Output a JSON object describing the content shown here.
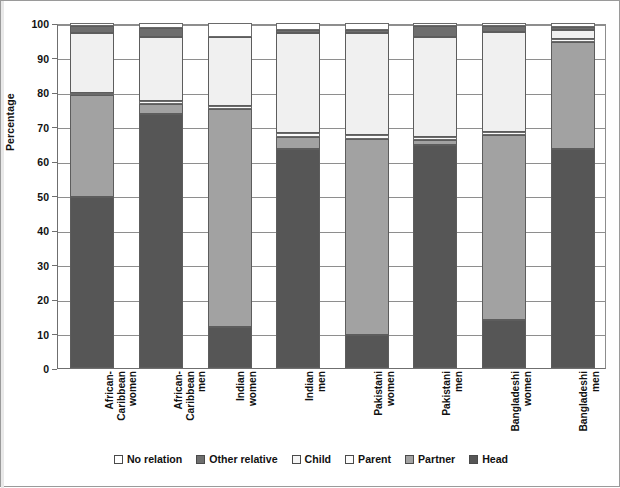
{
  "chart_data": {
    "type": "bar",
    "subtype": "stacked-bar-100",
    "title": "",
    "xlabel": "",
    "ylabel": "Percentage",
    "ylim": [
      0,
      100
    ],
    "yticks": [
      0,
      10,
      20,
      30,
      40,
      50,
      60,
      70,
      80,
      90,
      100
    ],
    "grid": true,
    "legend_position": "bottom",
    "categories": [
      "African-\nCaribbean\nwomen",
      "African-\nCaribbean\nmen",
      "Indian\nwomen",
      "Indian\nmen",
      "Pakistani\nwomen",
      "Pakistani\nmen",
      "Bangladeshi\nwomen",
      "Bangladeshi\nmen"
    ],
    "series": [
      {
        "name": "Head",
        "color": "#565656",
        "values": [
          49.5,
          73.5,
          12.0,
          63.5,
          9.5,
          64.5,
          14.0,
          63.5
        ]
      },
      {
        "name": "Partner",
        "color": "#a2a2a2",
        "values": [
          29.5,
          3.0,
          63.0,
          3.5,
          57.0,
          1.5,
          53.5,
          31.0
        ]
      },
      {
        "name": "Parent",
        "color": "#fbfbfb",
        "values": [
          0.8,
          1.0,
          1.0,
          1.0,
          1.0,
          1.0,
          1.0,
          1.0
        ]
      },
      {
        "name": "Child",
        "color": "#f0f0f0",
        "values": [
          17.2,
          18.5,
          20.0,
          29.0,
          29.5,
          29.0,
          29.0,
          2.5
        ]
      },
      {
        "name": "Other relative",
        "color": "#6e6e6e",
        "values": [
          2.0,
          2.5,
          0.0,
          1.0,
          1.0,
          3.0,
          1.5,
          0.8
        ]
      },
      {
        "name": "No relation",
        "color": "#ffffff",
        "values": [
          1.0,
          1.5,
          4.0,
          2.0,
          2.0,
          1.0,
          1.0,
          1.2
        ]
      }
    ],
    "stack_order_bottom_to_top": [
      "Head",
      "Partner",
      "Parent",
      "Child",
      "Other relative",
      "No relation"
    ]
  },
  "legend": {
    "items": [
      {
        "label": "No relation",
        "swatch": "#ffffff"
      },
      {
        "label": "Other relative",
        "swatch": "#6e6e6e"
      },
      {
        "label": "Child",
        "swatch": "#f5f5f5"
      },
      {
        "label": "Parent",
        "swatch": "#fbfbfb"
      },
      {
        "label": "Partner",
        "swatch": "#a2a2a2"
      },
      {
        "label": "Head",
        "swatch": "#565656"
      }
    ]
  },
  "axis": {
    "y_title": "Percentage",
    "y_tick_labels": [
      "0",
      "10",
      "20",
      "30",
      "40",
      "50",
      "60",
      "70",
      "80",
      "90",
      "100"
    ]
  }
}
